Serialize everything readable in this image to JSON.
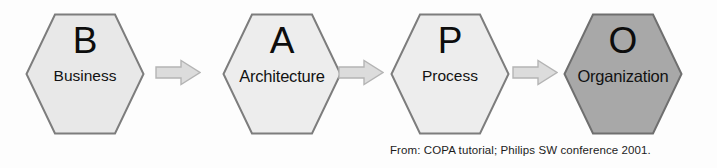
{
  "diagram": {
    "type": "horizontal-flow",
    "name": "BAPO model",
    "background_color": "#fdfdfd",
    "nodes": [
      {
        "id": "business",
        "initial": "B",
        "label": "Business",
        "fill": "#e8e8e8",
        "stroke": "#7d7d7d",
        "x": 25,
        "y": 13
      },
      {
        "id": "architecture",
        "initial": "A",
        "label": "Architecture",
        "fill": "#ededed",
        "stroke": "#7d7d7d",
        "x": 222,
        "y": 13
      },
      {
        "id": "process",
        "initial": "P",
        "label": "Process",
        "fill": "#ededed",
        "stroke": "#7d7d7d",
        "x": 390,
        "y": 13
      },
      {
        "id": "organization",
        "initial": "O",
        "label": "Organization",
        "fill": "#a8a8a8",
        "stroke": "#6f6f6f",
        "x": 563,
        "y": 13
      }
    ],
    "arrows": [
      {
        "id": "arrow-business-architecture",
        "x": 155,
        "y": 59,
        "fill": "#dcdcdc",
        "stroke": "#b4b4b4",
        "direction": "right"
      },
      {
        "id": "arrow-architecture-process",
        "x": 338,
        "y": 59,
        "fill": "#dcdcdc",
        "stroke": "#b4b4b4",
        "direction": "right"
      },
      {
        "id": "arrow-process-organization",
        "x": 512,
        "y": 59,
        "fill": "#dcdcdc",
        "stroke": "#b4b4b4",
        "direction": "right"
      }
    ],
    "caption": "From: COPA tutorial; Philips SW conference 2001."
  }
}
